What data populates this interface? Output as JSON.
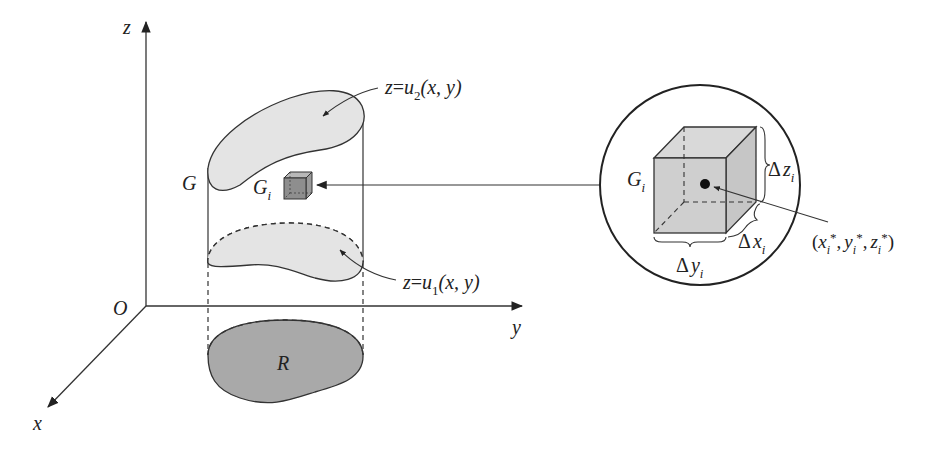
{
  "diagram": {
    "type": "triple-integral-partition",
    "axes": {
      "z_label": "z",
      "y_label": "y",
      "x_label": "x",
      "origin_label": "O"
    },
    "solid": {
      "region_label": "G",
      "projection_label": "R",
      "top_surface": {
        "lhs": "z",
        "eq": "=",
        "fn": "u",
        "sub": "2",
        "args": "(x, y)"
      },
      "bottom_surface": {
        "lhs": "z",
        "eq": "=",
        "fn": "u",
        "sub": "1",
        "args": "(x, y)"
      }
    },
    "subregion": {
      "label": "G",
      "label_sub": "i"
    },
    "magnified_view": {
      "cube_label": "G",
      "cube_label_sub": "i",
      "dx": {
        "delta": "Δ",
        "var": "x",
        "sub": "i"
      },
      "dy": {
        "delta": "Δ",
        "var": "y",
        "sub": "i"
      },
      "dz": {
        "delta": "Δ",
        "var": "z",
        "sub": "i"
      },
      "sample_point": {
        "open": "(",
        "x": "x",
        "y": "y",
        "z": "z",
        "sub": "i",
        "star": "*",
        "comma": ",",
        "close": ")"
      }
    },
    "colors": {
      "line": "#333333",
      "surface_fill": "#e4e4e4",
      "region_fill": "#a9a9a9",
      "cube_fill": "#cfcfcf",
      "small_cube_fill": "#8e8e8e"
    }
  }
}
